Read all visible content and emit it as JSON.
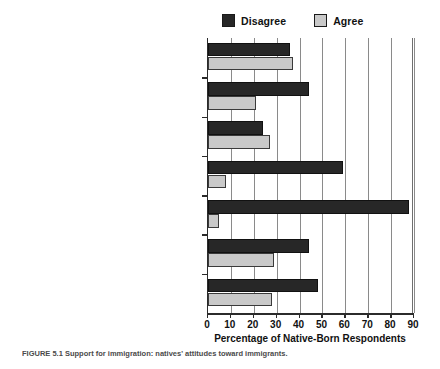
{
  "legend": {
    "items": [
      {
        "label": "Disagree",
        "color": "#272727",
        "icon": "square-swatch-icon"
      },
      {
        "label": "Agree",
        "color": "#c9c9c9",
        "icon": "square-swatch-icon"
      }
    ]
  },
  "caption": {
    "text": "FIGURE 5.1   Support for immigration: natives' attitudes toward immigrants."
  },
  "chart_data": {
    "type": "bar",
    "orientation": "horizontal",
    "title": "",
    "xlabel": "Percentage of Native-Born Respondents",
    "ylabel": "",
    "xlim": [
      0,
      90
    ],
    "xticks": [
      0,
      10,
      20,
      30,
      40,
      50,
      60,
      70,
      80,
      90
    ],
    "grid": true,
    "legend_position": "top",
    "categories": [
      "Immigrants (do not) take jobs\nfrom natives.",
      "Hispanic people will\nimprove life here.",
      "Asian people will\nimprove life here.",
      "This town would be better with\nmore immigrants.",
      "Immigrants should (not have to) learn\nto speak English ASAP.",
      "Immigrants work harder\nthan natives.",
      "There would (not) be fewer problems if\nthere were (more) immigrants."
    ],
    "series": [
      {
        "name": "Disagree",
        "color": "#272727",
        "values": [
          36,
          44,
          24,
          59,
          88,
          44,
          48
        ]
      },
      {
        "name": "Agree",
        "color": "#c9c9c9",
        "values": [
          37,
          21,
          27,
          8,
          5,
          29,
          28
        ]
      }
    ]
  }
}
